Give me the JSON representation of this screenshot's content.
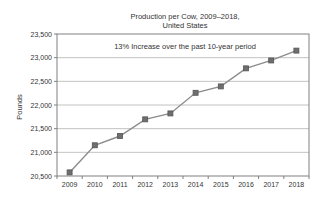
{
  "chart": {
    "title_line1": "Production per Cow, 2009–2018,",
    "title_line2": "United States",
    "annotation": "13% Increase over the past 10-year period",
    "ylabel": "Pounds"
  },
  "chart_data": {
    "type": "line",
    "title": "Production per Cow, 2009–2018, United States",
    "annotation": "13% Increase over the past 10-year period",
    "xlabel": "",
    "ylabel": "Pounds",
    "categories": [
      "2009",
      "2010",
      "2011",
      "2012",
      "2013",
      "2014",
      "2015",
      "2016",
      "2017",
      "2018"
    ],
    "series": [
      {
        "name": "Milk production per cow (pounds)",
        "values": [
          20576,
          21149,
          21345,
          21697,
          21822,
          22258,
          22393,
          22774,
          22941,
          23149
        ]
      }
    ],
    "ylim": [
      20500,
      23500
    ],
    "ytick_step": 500,
    "yticks": [
      "20,500",
      "21,000",
      "21,500",
      "22,000",
      "22,500",
      "23,000",
      "23,500"
    ],
    "grid": true,
    "legend": false,
    "marker": "square",
    "colors": {
      "line": "#8c8c8c",
      "marker_fill": "#6e6e6e",
      "marker_border": "#545454",
      "gridline": "#b3b3b3",
      "plot_border": "#808080",
      "text": "#333333",
      "background": "#ffffff"
    }
  }
}
